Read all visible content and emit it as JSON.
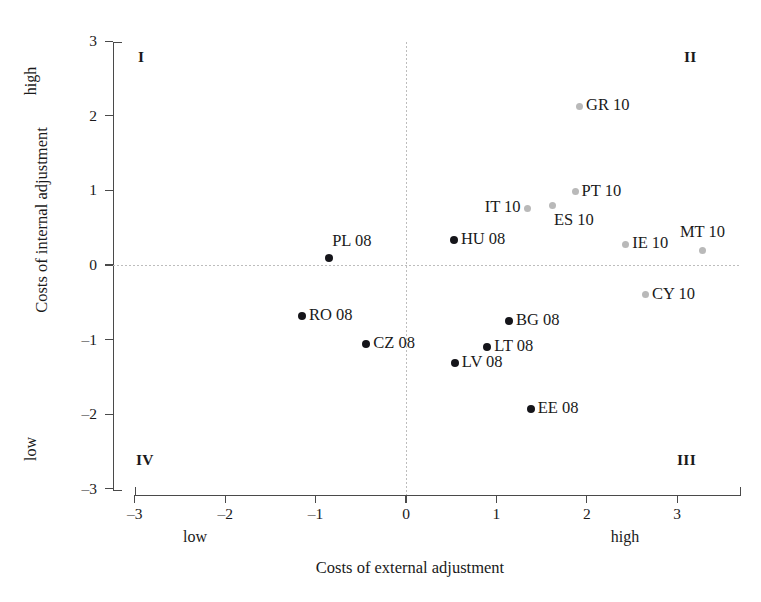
{
  "chart_data": {
    "type": "scatter",
    "title": "",
    "xlabel": "Costs of external adjustment",
    "ylabel": "Costs of internal adjustment",
    "xlim": [
      -3,
      3
    ],
    "ylim": [
      -3,
      3
    ],
    "xticks": [
      "-3",
      "-2",
      "-1",
      "0",
      "1",
      "2",
      "3"
    ],
    "yticks": [
      "3",
      "2",
      "1",
      "0",
      "-1",
      "-2",
      "-3"
    ],
    "grid": "origin-only",
    "legend": "none",
    "axis_annotations": {
      "x_low": "low",
      "x_high": "high",
      "y_low": "low",
      "y_high": "high"
    },
    "quadrant_labels": [
      {
        "label": "I",
        "corner": "top-left"
      },
      {
        "label": "II",
        "corner": "top-right"
      },
      {
        "label": "III",
        "corner": "bottom-right"
      },
      {
        "label": "IV",
        "corner": "bottom-left"
      }
    ],
    "series": [
      {
        "name": "2008 group",
        "color": "#15151a",
        "marker": "filled-circle-dark",
        "points": [
          {
            "label": "PL 08",
            "x": -0.85,
            "y": 0.09,
            "label_pos": "above-right"
          },
          {
            "label": "HU 08",
            "x": 0.53,
            "y": 0.33,
            "label_pos": "right"
          },
          {
            "label": "RO 08",
            "x": -1.15,
            "y": -0.68,
            "label_pos": "right"
          },
          {
            "label": "CZ 08",
            "x": -0.44,
            "y": -1.06,
            "label_pos": "right"
          },
          {
            "label": "BG 08",
            "x": 1.14,
            "y": -0.75,
            "label_pos": "right"
          },
          {
            "label": "LT 08",
            "x": 0.9,
            "y": -1.1,
            "label_pos": "right"
          },
          {
            "label": "LV 08",
            "x": 0.54,
            "y": -1.31,
            "label_pos": "right"
          },
          {
            "label": "EE 08",
            "x": 1.38,
            "y": -1.93,
            "label_pos": "right"
          }
        ]
      },
      {
        "name": "2010 group",
        "color": "#b9b9b9",
        "marker": "filled-circle-light",
        "points": [
          {
            "label": "GR 10",
            "x": 1.92,
            "y": 2.13,
            "label_pos": "right"
          },
          {
            "label": "PT 10",
            "x": 1.87,
            "y": 0.98,
            "label_pos": "right"
          },
          {
            "label": "ES 10",
            "x": 1.62,
            "y": 0.8,
            "label_pos": "below-right"
          },
          {
            "label": "IT 10",
            "x": 1.34,
            "y": 0.76,
            "label_pos": "left"
          },
          {
            "label": "IE 10",
            "x": 2.43,
            "y": 0.28,
            "label_pos": "right"
          },
          {
            "label": "MT 10",
            "x": 3.28,
            "y": 0.2,
            "label_pos": "above-left"
          },
          {
            "label": "CY 10",
            "x": 2.65,
            "y": -0.4,
            "label_pos": "right"
          }
        ]
      }
    ]
  }
}
